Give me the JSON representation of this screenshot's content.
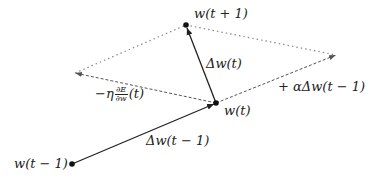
{
  "diagram": {
    "type": "momentum-gradient-descent-vector-diagram",
    "points": {
      "w_prev": {
        "label": "w(t − 1)",
        "x": 72,
        "y": 164
      },
      "w_curr": {
        "label": "w(t)",
        "x": 216,
        "y": 103
      },
      "w_next": {
        "label": "w(t + 1)",
        "x": 186,
        "y": 25
      },
      "grad_tip": {
        "x": 75,
        "y": 73
      },
      "momentum_tip": {
        "x": 336,
        "y": 55
      }
    },
    "labels": {
      "w_prev": "w(t − 1)",
      "w_curr": "w(t)",
      "w_next": "w(t + 1)",
      "delta_prev": "Δw(t − 1)",
      "delta_curr": "Δw(t)",
      "momentum": "+ αΔw(t − 1)",
      "gradient_prefix": "−η",
      "gradient_num": "∂E",
      "gradient_den": "∂w",
      "gradient_suffix": "(t)"
    },
    "colors": {
      "line": "#222222",
      "dashed": "#555555",
      "dotted": "#888888"
    }
  }
}
